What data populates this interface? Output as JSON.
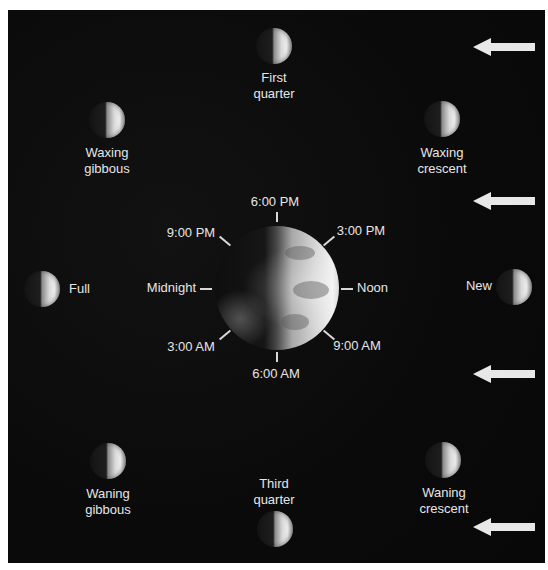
{
  "diagram": {
    "colors": {
      "background": "#0b0b0b",
      "text": "#e6e6e6",
      "arrow": "#e8e8e8",
      "page": "#ffffff"
    },
    "sunlight_arrows": [
      {
        "direction": "left",
        "y": 47
      },
      {
        "direction": "left",
        "y": 201
      },
      {
        "direction": "left",
        "y": 374
      },
      {
        "direction": "left",
        "y": 527
      }
    ],
    "moon_phases": [
      {
        "id": "first-quarter",
        "lines": [
          "First",
          "quarter"
        ]
      },
      {
        "id": "waxing-gibbous",
        "lines": [
          "Waxing",
          "gibbous"
        ]
      },
      {
        "id": "waxing-crescent",
        "lines": [
          "Waxing",
          "crescent"
        ]
      },
      {
        "id": "full",
        "lines": [
          "Full"
        ]
      },
      {
        "id": "new",
        "lines": [
          "New"
        ]
      },
      {
        "id": "waning-gibbous",
        "lines": [
          "Waning",
          "gibbous"
        ]
      },
      {
        "id": "third-quarter",
        "lines": [
          "Third",
          "quarter"
        ]
      },
      {
        "id": "waning-crescent",
        "lines": [
          "Waning",
          "crescent"
        ]
      }
    ],
    "earth_times": {
      "top": "6:00 PM",
      "top_left": "9:00 PM",
      "top_right": "3:00 PM",
      "left": "Midnight",
      "right": "Noon",
      "bottom_left": "3:00 AM",
      "bottom_right": "9:00 AM",
      "bottom": "6:00 AM"
    }
  }
}
